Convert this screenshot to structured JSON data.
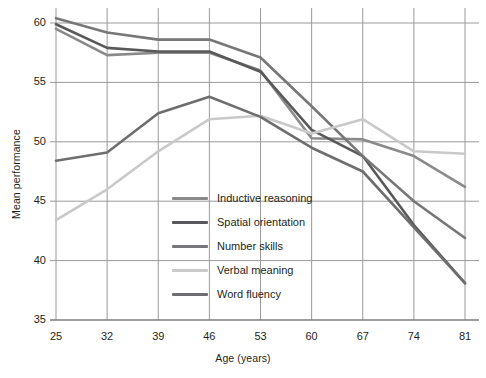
{
  "chart_data": {
    "type": "line",
    "title": "",
    "xlabel": "Age (years)",
    "ylabel": "Mean performance",
    "x": [
      25,
      32,
      39,
      46,
      53,
      60,
      67,
      74,
      81
    ],
    "xtick_labels": [
      "25",
      "32",
      "39",
      "46",
      "53",
      "60",
      "67",
      "74",
      "81"
    ],
    "ytick_labels": [
      "35",
      "40",
      "45",
      "50",
      "55",
      "60"
    ],
    "yticks": [
      35,
      40,
      45,
      50,
      55,
      60
    ],
    "xlim": [
      25,
      81
    ],
    "ylim": [
      35,
      61.5
    ],
    "grid": true,
    "legend_position": "center",
    "series": [
      {
        "name": "Inductive reasoning",
        "color": "#8a8a8a",
        "values": [
          59.5,
          57.3,
          57.5,
          57.5,
          56.0,
          50.3,
          50.2,
          48.8,
          46.2
        ]
      },
      {
        "name": "Spatial orientation",
        "color": "#59595b",
        "values": [
          59.9,
          57.9,
          57.6,
          57.6,
          55.9,
          51.0,
          48.8,
          43.0,
          38.1
        ]
      },
      {
        "name": "Number skills",
        "color": "#77777a",
        "values": [
          60.4,
          59.2,
          58.6,
          58.6,
          57.1,
          53.0,
          48.8,
          45.0,
          41.9
        ]
      },
      {
        "name": "Verbal meaning",
        "color": "#c9c9c9",
        "values": [
          43.4,
          46.0,
          49.2,
          51.9,
          52.2,
          50.7,
          51.9,
          49.2,
          49.0
        ]
      },
      {
        "name": "Word fluency",
        "color": "#6e6e70",
        "values": [
          48.4,
          49.1,
          52.4,
          53.8,
          52.1,
          49.5,
          47.5,
          42.8,
          38.1
        ]
      }
    ]
  },
  "axes": {
    "y_title": "Mean performance",
    "x_title": "Age (years)"
  },
  "style": {
    "grid_color": "#9a9a9a",
    "axis_color": "#6f6f6f",
    "background": "#ffffff"
  }
}
